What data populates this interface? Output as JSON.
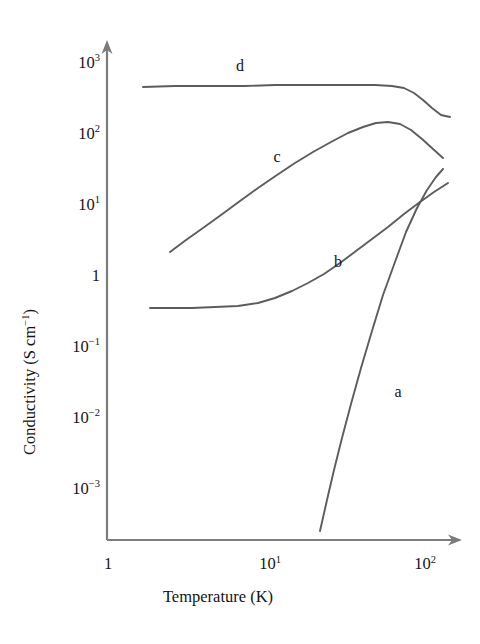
{
  "chart_data": {
    "type": "line",
    "title": "",
    "xlabel": "Temperature (K)",
    "ylabel": "Conductivity (S cm⁻¹)",
    "xscale": "log",
    "yscale": "log",
    "xlim": [
      1,
      200
    ],
    "ylim": [
      0.0002,
      1000
    ],
    "grid": false,
    "legend": "inline-curve-labels",
    "xticks": [
      {
        "value": 1,
        "label_base": "1",
        "label_exp": "",
        "px": 108
      },
      {
        "value": 10,
        "label_base": "10",
        "label_exp": "1",
        "px": 270
      },
      {
        "value": 100,
        "label_base": "10",
        "label_exp": "2",
        "px": 425
      }
    ],
    "yticks": [
      {
        "value": 1000,
        "label_base": "10",
        "label_exp": "3",
        "px": 63
      },
      {
        "value": 100,
        "label_base": "10",
        "label_exp": "2",
        "px": 134
      },
      {
        "value": 10,
        "label_base": "10",
        "label_exp": "1",
        "px": 205
      },
      {
        "value": 1,
        "label_base": "1",
        "label_exp": "",
        "px": 276
      },
      {
        "value": 0.1,
        "label_base": "10",
        "label_exp": "−1",
        "px": 347
      },
      {
        "value": 0.01,
        "label_base": "10",
        "label_exp": "−2",
        "px": 418
      },
      {
        "value": 0.001,
        "label_base": "10",
        "label_exp": "−3",
        "px": 489
      }
    ],
    "series": [
      {
        "name": "a",
        "label": "a",
        "label_px": {
          "x": 398,
          "y": 392
        },
        "points_px": "320,531 327,500 334,470 342,438 351,404 361,368 372,331 383,295 395,262 406,232 417,208 427,190 436,177 443,169",
        "points_data": [
          {
            "T": 21,
            "sigma": 0.00035
          },
          {
            "T": 25,
            "sigma": 0.0012
          },
          {
            "T": 30,
            "sigma": 0.0046
          },
          {
            "T": 40,
            "sigma": 0.025
          },
          {
            "T": 50,
            "sigma": 0.09
          },
          {
            "T": 70,
            "sigma": 0.45
          },
          {
            "T": 100,
            "sigma": 1.5
          },
          {
            "T": 140,
            "sigma": 2.5
          }
        ]
      },
      {
        "name": "b",
        "label": "b",
        "label_px": {
          "x": 338,
          "y": 262
        },
        "points_px": "150,308 170,308 192,308 215,307 238,306 258,303 275,298 292,291 308,283 324,274 340,263 356,251 372,239 388,227 404,214 420,202 434,192 448,183",
        "points_data": [
          {
            "T": 1.6,
            "sigma": 0.36
          },
          {
            "T": 3,
            "sigma": 0.37
          },
          {
            "T": 6,
            "sigma": 0.4
          },
          {
            "T": 10,
            "sigma": 0.5
          },
          {
            "T": 20,
            "sigma": 1.3
          },
          {
            "T": 40,
            "sigma": 5.0
          },
          {
            "T": 80,
            "sigma": 14
          },
          {
            "T": 150,
            "sigma": 25
          }
        ]
      },
      {
        "name": "c",
        "label": "c",
        "label_px": {
          "x": 277,
          "y": 157
        },
        "points_px": "170,252 186,240 203,228 221,215 240,201 258,188 277,175 295,163 313,152 331,142 348,133 363,127 376,123 388,122 400,124 411,130 422,139 433,149 443,158",
        "points_data": [
          {
            "T": 2.2,
            "sigma": 2.4
          },
          {
            "T": 4,
            "sigma": 6
          },
          {
            "T": 8,
            "sigma": 14
          },
          {
            "T": 15,
            "sigma": 30
          },
          {
            "T": 30,
            "sigma": 65
          },
          {
            "T": 55,
            "sigma": 125
          },
          {
            "T": 70,
            "sigma": 130
          },
          {
            "T": 100,
            "sigma": 95
          },
          {
            "T": 160,
            "sigma": 48
          }
        ]
      },
      {
        "name": "d",
        "label": "d",
        "label_px": {
          "x": 240,
          "y": 66
        },
        "points_px": "143,87 175,86 210,86 245,86 275,85 305,85 330,85 355,85 375,85 392,86 404,88 414,93 423,100 432,108 441,115 450,117",
        "points_data": [
          {
            "T": 1.4,
            "sigma": 470
          },
          {
            "T": 5,
            "sigma": 480
          },
          {
            "T": 20,
            "sigma": 490
          },
          {
            "T": 50,
            "sigma": 490
          },
          {
            "T": 70,
            "sigma": 480
          },
          {
            "T": 90,
            "sigma": 440
          },
          {
            "T": 120,
            "sigma": 290
          },
          {
            "T": 170,
            "sigma": 160
          }
        ]
      }
    ],
    "axis_geometry_px": {
      "origin": {
        "x": 107,
        "y": 540
      },
      "y_axis_top": {
        "x": 107,
        "y": 42
      },
      "x_axis_right": {
        "x": 462,
        "y": 540
      }
    },
    "colors": {
      "axis": "#7c7c7c",
      "curve": "#5c5c5c",
      "text": "#141414",
      "background": "#ffffff"
    }
  }
}
